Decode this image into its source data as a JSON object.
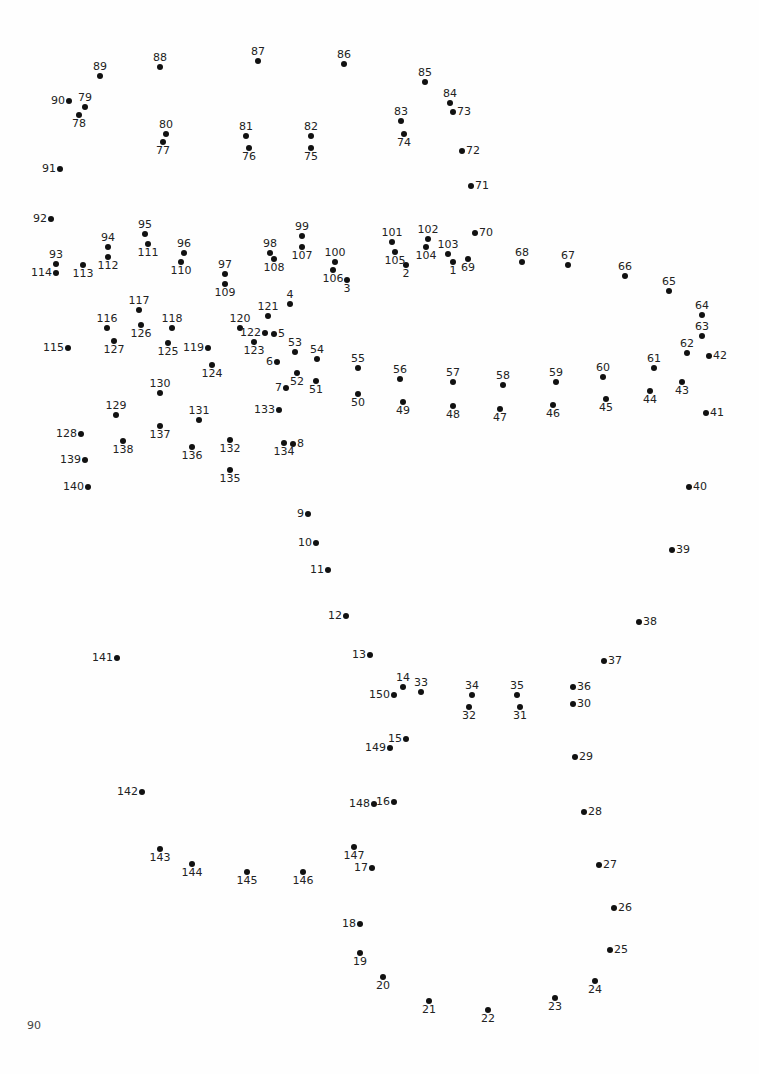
{
  "worksheet": {
    "type": "connect-the-dots",
    "page_number": "90",
    "dot_color": "#111111",
    "text_color": "#222222",
    "background": "#fefefe",
    "dots": [
      {
        "n": "1",
        "x": 453,
        "y": 262,
        "pos": "b"
      },
      {
        "n": "2",
        "x": 406,
        "y": 265,
        "pos": "b"
      },
      {
        "n": "3",
        "x": 347,
        "y": 280,
        "pos": "b"
      },
      {
        "n": "4",
        "x": 290,
        "y": 304,
        "pos": "t"
      },
      {
        "n": "5",
        "x": 274,
        "y": 334,
        "pos": "r"
      },
      {
        "n": "6",
        "x": 277,
        "y": 362,
        "pos": "l"
      },
      {
        "n": "7",
        "x": 286,
        "y": 388,
        "pos": "l"
      },
      {
        "n": "8",
        "x": 293,
        "y": 444,
        "pos": "r"
      },
      {
        "n": "9",
        "x": 308,
        "y": 514,
        "pos": "l"
      },
      {
        "n": "10",
        "x": 316,
        "y": 543,
        "pos": "l"
      },
      {
        "n": "11",
        "x": 328,
        "y": 570,
        "pos": "l"
      },
      {
        "n": "12",
        "x": 346,
        "y": 616,
        "pos": "l"
      },
      {
        "n": "13",
        "x": 370,
        "y": 655,
        "pos": "l"
      },
      {
        "n": "14",
        "x": 403,
        "y": 687,
        "pos": "t"
      },
      {
        "n": "15",
        "x": 406,
        "y": 739,
        "pos": "l"
      },
      {
        "n": "16",
        "x": 394,
        "y": 802,
        "pos": "l"
      },
      {
        "n": "17",
        "x": 372,
        "y": 868,
        "pos": "l"
      },
      {
        "n": "18",
        "x": 360,
        "y": 924,
        "pos": "l"
      },
      {
        "n": "19",
        "x": 360,
        "y": 953,
        "pos": "b"
      },
      {
        "n": "20",
        "x": 383,
        "y": 977,
        "pos": "b"
      },
      {
        "n": "21",
        "x": 429,
        "y": 1001,
        "pos": "b"
      },
      {
        "n": "22",
        "x": 488,
        "y": 1010,
        "pos": "b"
      },
      {
        "n": "23",
        "x": 555,
        "y": 998,
        "pos": "b"
      },
      {
        "n": "24",
        "x": 595,
        "y": 981,
        "pos": "b"
      },
      {
        "n": "25",
        "x": 610,
        "y": 950,
        "pos": "r"
      },
      {
        "n": "26",
        "x": 614,
        "y": 908,
        "pos": "r"
      },
      {
        "n": "27",
        "x": 599,
        "y": 865,
        "pos": "r"
      },
      {
        "n": "28",
        "x": 584,
        "y": 812,
        "pos": "r"
      },
      {
        "n": "29",
        "x": 575,
        "y": 757,
        "pos": "r"
      },
      {
        "n": "30",
        "x": 573,
        "y": 704,
        "pos": "r"
      },
      {
        "n": "31",
        "x": 520,
        "y": 707,
        "pos": "b"
      },
      {
        "n": "32",
        "x": 469,
        "y": 707,
        "pos": "b"
      },
      {
        "n": "33",
        "x": 421,
        "y": 692,
        "pos": "t"
      },
      {
        "n": "34",
        "x": 472,
        "y": 695,
        "pos": "t"
      },
      {
        "n": "35",
        "x": 517,
        "y": 695,
        "pos": "t"
      },
      {
        "n": "36",
        "x": 573,
        "y": 687,
        "pos": "r"
      },
      {
        "n": "37",
        "x": 604,
        "y": 661,
        "pos": "r"
      },
      {
        "n": "38",
        "x": 639,
        "y": 622,
        "pos": "r"
      },
      {
        "n": "39",
        "x": 672,
        "y": 550,
        "pos": "r"
      },
      {
        "n": "40",
        "x": 689,
        "y": 487,
        "pos": "r"
      },
      {
        "n": "41",
        "x": 706,
        "y": 413,
        "pos": "r"
      },
      {
        "n": "42",
        "x": 709,
        "y": 356,
        "pos": "r"
      },
      {
        "n": "43",
        "x": 682,
        "y": 382,
        "pos": "b"
      },
      {
        "n": "44",
        "x": 650,
        "y": 391,
        "pos": "b"
      },
      {
        "n": "45",
        "x": 606,
        "y": 399,
        "pos": "b"
      },
      {
        "n": "46",
        "x": 553,
        "y": 405,
        "pos": "b"
      },
      {
        "n": "47",
        "x": 500,
        "y": 409,
        "pos": "b"
      },
      {
        "n": "48",
        "x": 453,
        "y": 406,
        "pos": "b"
      },
      {
        "n": "49",
        "x": 403,
        "y": 402,
        "pos": "b"
      },
      {
        "n": "50",
        "x": 358,
        "y": 394,
        "pos": "b"
      },
      {
        "n": "51",
        "x": 316,
        "y": 381,
        "pos": "b"
      },
      {
        "n": "52",
        "x": 297,
        "y": 373,
        "pos": "b"
      },
      {
        "n": "53",
        "x": 295,
        "y": 352,
        "pos": "t"
      },
      {
        "n": "54",
        "x": 317,
        "y": 359,
        "pos": "t"
      },
      {
        "n": "55",
        "x": 358,
        "y": 368,
        "pos": "t"
      },
      {
        "n": "56",
        "x": 400,
        "y": 379,
        "pos": "t"
      },
      {
        "n": "57",
        "x": 453,
        "y": 382,
        "pos": "t"
      },
      {
        "n": "58",
        "x": 503,
        "y": 385,
        "pos": "t"
      },
      {
        "n": "59",
        "x": 556,
        "y": 382,
        "pos": "t"
      },
      {
        "n": "60",
        "x": 603,
        "y": 377,
        "pos": "t"
      },
      {
        "n": "61",
        "x": 654,
        "y": 368,
        "pos": "t"
      },
      {
        "n": "62",
        "x": 687,
        "y": 353,
        "pos": "t"
      },
      {
        "n": "63",
        "x": 702,
        "y": 336,
        "pos": "t"
      },
      {
        "n": "64",
        "x": 702,
        "y": 315,
        "pos": "t"
      },
      {
        "n": "65",
        "x": 669,
        "y": 291,
        "pos": "t"
      },
      {
        "n": "66",
        "x": 625,
        "y": 276,
        "pos": "t"
      },
      {
        "n": "67",
        "x": 568,
        "y": 265,
        "pos": "t"
      },
      {
        "n": "68",
        "x": 522,
        "y": 262,
        "pos": "t"
      },
      {
        "n": "69",
        "x": 468,
        "y": 259,
        "pos": "b"
      },
      {
        "n": "70",
        "x": 475,
        "y": 233,
        "pos": "r"
      },
      {
        "n": "71",
        "x": 471,
        "y": 186,
        "pos": "r"
      },
      {
        "n": "72",
        "x": 462,
        "y": 151,
        "pos": "r"
      },
      {
        "n": "73",
        "x": 453,
        "y": 112,
        "pos": "r"
      },
      {
        "n": "74",
        "x": 404,
        "y": 134,
        "pos": "b"
      },
      {
        "n": "75",
        "x": 311,
        "y": 148,
        "pos": "b"
      },
      {
        "n": "76",
        "x": 249,
        "y": 148,
        "pos": "b"
      },
      {
        "n": "77",
        "x": 163,
        "y": 142,
        "pos": "b"
      },
      {
        "n": "78",
        "x": 79,
        "y": 115,
        "pos": "b"
      },
      {
        "n": "79",
        "x": 85,
        "y": 107,
        "pos": "t"
      },
      {
        "n": "80",
        "x": 166,
        "y": 134,
        "pos": "t"
      },
      {
        "n": "81",
        "x": 246,
        "y": 136,
        "pos": "t"
      },
      {
        "n": "82",
        "x": 311,
        "y": 136,
        "pos": "t"
      },
      {
        "n": "83",
        "x": 401,
        "y": 121,
        "pos": "t"
      },
      {
        "n": "84",
        "x": 450,
        "y": 103,
        "pos": "t"
      },
      {
        "n": "85",
        "x": 425,
        "y": 82,
        "pos": "t"
      },
      {
        "n": "86",
        "x": 344,
        "y": 64,
        "pos": "t"
      },
      {
        "n": "87",
        "x": 258,
        "y": 61,
        "pos": "t"
      },
      {
        "n": "88",
        "x": 160,
        "y": 67,
        "pos": "t"
      },
      {
        "n": "89",
        "x": 100,
        "y": 76,
        "pos": "t"
      },
      {
        "n": "90",
        "x": 69,
        "y": 101,
        "pos": "l"
      },
      {
        "n": "91",
        "x": 60,
        "y": 169,
        "pos": "l"
      },
      {
        "n": "92",
        "x": 51,
        "y": 219,
        "pos": "l"
      },
      {
        "n": "93",
        "x": 56,
        "y": 264,
        "pos": "t"
      },
      {
        "n": "94",
        "x": 108,
        "y": 247,
        "pos": "t"
      },
      {
        "n": "95",
        "x": 145,
        "y": 234,
        "pos": "t"
      },
      {
        "n": "96",
        "x": 184,
        "y": 253,
        "pos": "t"
      },
      {
        "n": "97",
        "x": 225,
        "y": 274,
        "pos": "t"
      },
      {
        "n": "98",
        "x": 270,
        "y": 253,
        "pos": "t"
      },
      {
        "n": "99",
        "x": 302,
        "y": 236,
        "pos": "t"
      },
      {
        "n": "100",
        "x": 335,
        "y": 262,
        "pos": "t"
      },
      {
        "n": "101",
        "x": 392,
        "y": 242,
        "pos": "t"
      },
      {
        "n": "102",
        "x": 428,
        "y": 239,
        "pos": "t"
      },
      {
        "n": "103",
        "x": 448,
        "y": 254,
        "pos": "t"
      },
      {
        "n": "104",
        "x": 426,
        "y": 247,
        "pos": "b"
      },
      {
        "n": "105",
        "x": 395,
        "y": 252,
        "pos": "b"
      },
      {
        "n": "106",
        "x": 333,
        "y": 270,
        "pos": "b"
      },
      {
        "n": "107",
        "x": 302,
        "y": 247,
        "pos": "b"
      },
      {
        "n": "108",
        "x": 274,
        "y": 259,
        "pos": "b"
      },
      {
        "n": "109",
        "x": 225,
        "y": 284,
        "pos": "b"
      },
      {
        "n": "110",
        "x": 181,
        "y": 262,
        "pos": "b"
      },
      {
        "n": "111",
        "x": 148,
        "y": 244,
        "pos": "b"
      },
      {
        "n": "112",
        "x": 108,
        "y": 257,
        "pos": "b"
      },
      {
        "n": "113",
        "x": 83,
        "y": 265,
        "pos": "b"
      },
      {
        "n": "114",
        "x": 56,
        "y": 273,
        "pos": "l"
      },
      {
        "n": "115",
        "x": 68,
        "y": 348,
        "pos": "l"
      },
      {
        "n": "116",
        "x": 107,
        "y": 328,
        "pos": "t"
      },
      {
        "n": "117",
        "x": 139,
        "y": 310,
        "pos": "t"
      },
      {
        "n": "118",
        "x": 172,
        "y": 328,
        "pos": "t"
      },
      {
        "n": "119",
        "x": 208,
        "y": 348,
        "pos": "l"
      },
      {
        "n": "120",
        "x": 240,
        "y": 328,
        "pos": "t"
      },
      {
        "n": "121",
        "x": 268,
        "y": 316,
        "pos": "t"
      },
      {
        "n": "122",
        "x": 265,
        "y": 333,
        "pos": "l"
      },
      {
        "n": "123",
        "x": 254,
        "y": 342,
        "pos": "b"
      },
      {
        "n": "124",
        "x": 212,
        "y": 365,
        "pos": "b"
      },
      {
        "n": "125",
        "x": 168,
        "y": 343,
        "pos": "b"
      },
      {
        "n": "126",
        "x": 141,
        "y": 325,
        "pos": "b"
      },
      {
        "n": "127",
        "x": 114,
        "y": 341,
        "pos": "b"
      },
      {
        "n": "128",
        "x": 81,
        "y": 434,
        "pos": "l"
      },
      {
        "n": "129",
        "x": 116,
        "y": 415,
        "pos": "t"
      },
      {
        "n": "130",
        "x": 160,
        "y": 393,
        "pos": "t"
      },
      {
        "n": "131",
        "x": 199,
        "y": 420,
        "pos": "t"
      },
      {
        "n": "132",
        "x": 230,
        "y": 440,
        "pos": "b"
      },
      {
        "n": "133",
        "x": 279,
        "y": 410,
        "pos": "l"
      },
      {
        "n": "134",
        "x": 284,
        "y": 443,
        "pos": "b"
      },
      {
        "n": "135",
        "x": 230,
        "y": 470,
        "pos": "b"
      },
      {
        "n": "136",
        "x": 192,
        "y": 447,
        "pos": "b"
      },
      {
        "n": "137",
        "x": 160,
        "y": 426,
        "pos": "b"
      },
      {
        "n": "138",
        "x": 123,
        "y": 441,
        "pos": "b"
      },
      {
        "n": "139",
        "x": 85,
        "y": 460,
        "pos": "l"
      },
      {
        "n": "140",
        "x": 88,
        "y": 487,
        "pos": "l"
      },
      {
        "n": "141",
        "x": 117,
        "y": 658,
        "pos": "l"
      },
      {
        "n": "142",
        "x": 142,
        "y": 792,
        "pos": "l"
      },
      {
        "n": "143",
        "x": 160,
        "y": 849,
        "pos": "b"
      },
      {
        "n": "144",
        "x": 192,
        "y": 864,
        "pos": "b"
      },
      {
        "n": "145",
        "x": 247,
        "y": 872,
        "pos": "b"
      },
      {
        "n": "146",
        "x": 303,
        "y": 872,
        "pos": "b"
      },
      {
        "n": "147",
        "x": 354,
        "y": 847,
        "pos": "b"
      },
      {
        "n": "148",
        "x": 374,
        "y": 804,
        "pos": "l"
      },
      {
        "n": "149",
        "x": 390,
        "y": 748,
        "pos": "l"
      },
      {
        "n": "150",
        "x": 394,
        "y": 695,
        "pos": "l"
      }
    ]
  }
}
